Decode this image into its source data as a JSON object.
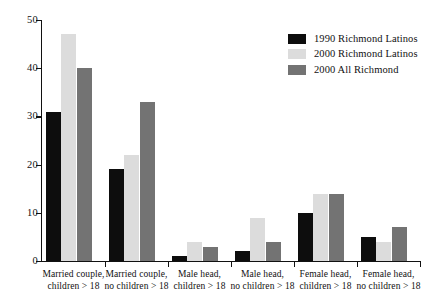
{
  "chart_data": {
    "type": "bar",
    "title": "",
    "xlabel": "",
    "ylabel": "",
    "ylim": [
      0,
      50
    ],
    "yticks": [
      0,
      10,
      20,
      30,
      40,
      50
    ],
    "grid": false,
    "legend_position": "top-right",
    "categories": [
      "Married couple,\nchildren > 18",
      "Married couple,\nno children > 18",
      "Male head,\nchildren > 18",
      "Male head,\nno children > 18",
      "Female head,\nchildren > 18",
      "Female head,\nno children > 18"
    ],
    "series": [
      {
        "name": "1990 Richmond Latinos",
        "color": "#0d0d0d",
        "values": [
          31,
          19,
          1,
          2,
          10,
          5
        ]
      },
      {
        "name": "2000 Richmond Latinos",
        "color": "#dcdcdc",
        "values": [
          47,
          22,
          4,
          9,
          14,
          4
        ]
      },
      {
        "name": "2000 All Richmond",
        "color": "#737373",
        "values": [
          40,
          33,
          3,
          4,
          14,
          7
        ]
      }
    ]
  },
  "axis": {
    "y_tick_labels": [
      "0",
      "10",
      "20",
      "30",
      "40",
      "50"
    ]
  },
  "legend": {
    "items": [
      {
        "label": "1990 Richmond Latinos"
      },
      {
        "label": "2000 Richmond Latinos"
      },
      {
        "label": "2000 All Richmond"
      }
    ]
  }
}
